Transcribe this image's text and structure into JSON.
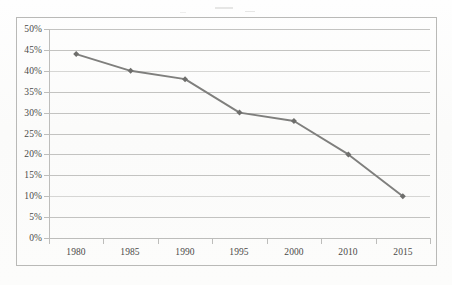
{
  "chart_data": {
    "type": "line",
    "title": "",
    "subtitle": "",
    "xlabel": "",
    "ylabel": "",
    "categories": [
      "1980",
      "1985",
      "1990",
      "1995",
      "2000",
      "2010",
      "2015"
    ],
    "values": [
      44,
      40,
      38,
      30,
      28,
      20,
      10
    ],
    "value_labels": [
      "44%",
      "40%",
      "38%",
      "30%",
      "28%",
      "20%",
      "10%"
    ],
    "series": [
      {
        "name": "",
        "values": [
          44,
          40,
          38,
          30,
          28,
          20,
          10
        ]
      }
    ],
    "ylim": [
      0,
      50
    ],
    "ytick_values": [
      0,
      5,
      10,
      15,
      20,
      25,
      30,
      35,
      40,
      45,
      50
    ],
    "ytick_labels": [
      "0%",
      "5%",
      "10%",
      "15%",
      "20%",
      "25%",
      "30%",
      "35%",
      "40%",
      "45%",
      "50%"
    ],
    "grid": true,
    "grid_axis": "y",
    "legend": false,
    "legend_position": "none",
    "marker": "diamond",
    "annotations": []
  },
  "style": {
    "line_color": "#7f7f7d",
    "marker_color": "#6e6e6c",
    "grid_color": "#c3c3c1",
    "axis_color": "#bdbdbb",
    "text_color": "#4a4a48",
    "border_color": "#b9b9b7",
    "background": "#fdfdfc"
  }
}
